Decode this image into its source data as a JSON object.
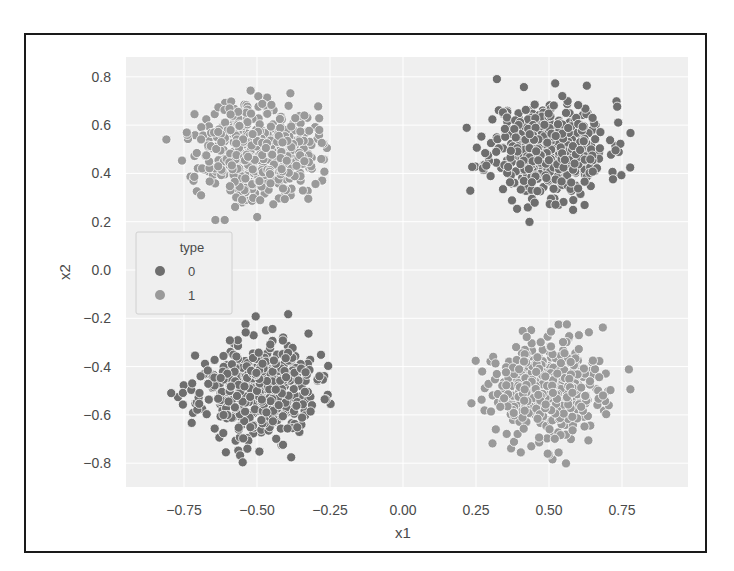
{
  "chart_data": {
    "type": "scatter",
    "title": "",
    "xlabel": "x1",
    "ylabel": "x2",
    "xlim": [
      -0.88,
      0.97
    ],
    "ylim": [
      -0.9,
      0.88
    ],
    "xticks": [
      -0.75,
      -0.5,
      -0.25,
      0.0,
      0.25,
      0.5,
      0.75
    ],
    "xtick_labels": [
      "−0.75",
      "−0.50",
      "−0.25",
      "0.00",
      "0.25",
      "0.50",
      "0.75"
    ],
    "yticks": [
      0.8,
      0.6,
      0.4,
      0.2,
      0.0,
      -0.2,
      -0.4,
      -0.6,
      -0.8
    ],
    "ytick_labels": [
      "0.8",
      "0.6",
      "0.4",
      "0.2",
      "0.0",
      "−0.2",
      "−0.4",
      "−0.6",
      "−0.8"
    ],
    "grid": true,
    "legend": {
      "title": "type",
      "position": "center left",
      "entries": [
        {
          "label": "0",
          "color": "#6e6e6e"
        },
        {
          "label": "1",
          "color": "#9a9a9a"
        }
      ]
    },
    "series": [
      {
        "name": "0",
        "color": "#6e6e6e",
        "clusters": [
          {
            "center": [
              0.5,
              0.5
            ],
            "std": [
              0.1,
              0.1
            ],
            "n": 500,
            "seed": 11
          },
          {
            "center": [
              -0.5,
              -0.5
            ],
            "std": [
              0.1,
              0.1
            ],
            "n": 500,
            "seed": 23
          }
        ]
      },
      {
        "name": "1",
        "color": "#9a9a9a",
        "clusters": [
          {
            "center": [
              -0.5,
              0.5
            ],
            "std": [
              0.1,
              0.1
            ],
            "n": 500,
            "seed": 37
          },
          {
            "center": [
              0.5,
              -0.5
            ],
            "std": [
              0.1,
              0.1
            ],
            "n": 500,
            "seed": 53
          }
        ]
      }
    ]
  },
  "colors": {
    "plot_background": "#efefef",
    "frame_border": "#1a1a1a",
    "grid": "#ffffff"
  }
}
